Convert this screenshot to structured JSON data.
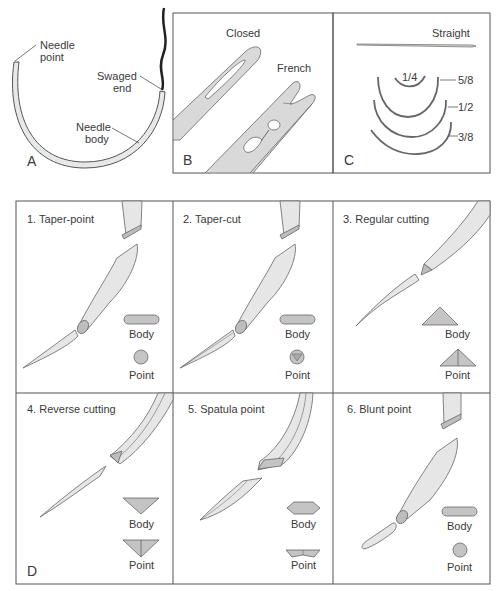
{
  "panel_a": {
    "letter": "A",
    "labels": {
      "needle_point_1": "Needle",
      "needle_point_2": "point",
      "swaged_1": "Swaged",
      "swaged_2": "end",
      "body_1": "Needle",
      "body_2": "body"
    }
  },
  "panel_b": {
    "letter": "B",
    "closed": "Closed",
    "french": "French"
  },
  "panel_c": {
    "letter": "C",
    "straight": "Straight",
    "curves": [
      "1/4",
      "5/8",
      "1/2",
      "3/8"
    ]
  },
  "panel_d": {
    "letter": "D",
    "cells": [
      {
        "title": "1.  Taper-point",
        "body": "Body",
        "point": "Point"
      },
      {
        "title": "2.  Taper-cut",
        "body": "Body",
        "point": "Point"
      },
      {
        "title": "3.  Regular cutting",
        "body": "Body",
        "point": "Point"
      },
      {
        "title": "4.  Reverse cutting",
        "body": "Body",
        "point": "Point"
      },
      {
        "title": "5.  Spatula point",
        "body": "Body",
        "point": "Point"
      },
      {
        "title": "6.  Blunt point",
        "body": "Body",
        "point": "Point"
      }
    ]
  },
  "colors": {
    "fill_light": "#e6e6e6",
    "fill_mid": "#c4c4c4",
    "stroke": "#555555",
    "border": "#555555",
    "suture": "#222222"
  }
}
